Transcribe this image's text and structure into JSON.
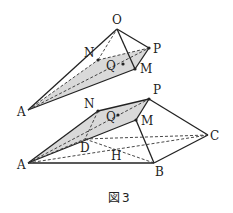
{
  "figure": {
    "caption_box": "図",
    "caption_num": "3",
    "shade_color": "#d9d9d9",
    "line_color": "#222222"
  },
  "upper": {
    "labels": {
      "O": "O",
      "P": "P",
      "M": "M",
      "N": "N",
      "Q": "Q",
      "A": "A"
    },
    "points": {
      "O": [
        117,
        29
      ],
      "P": [
        149,
        48
      ],
      "M": [
        135,
        69
      ],
      "N": [
        98,
        60
      ],
      "Q": [
        118,
        64
      ],
      "A": [
        28,
        110
      ]
    }
  },
  "lower": {
    "labels": {
      "N": "N",
      "P": "P",
      "M": "M",
      "Q": "Q",
      "A": "A",
      "D": "D",
      "H": "H",
      "B": "B",
      "C": "C"
    },
    "points": {
      "N": [
        98,
        111
      ],
      "P": [
        149,
        99
      ],
      "M": [
        136,
        120
      ],
      "Q": [
        118,
        115
      ],
      "A": [
        28,
        163
      ],
      "D": [
        85,
        139
      ],
      "H": [
        115,
        160
      ],
      "B": [
        154,
        163
      ],
      "C": [
        208,
        135
      ]
    }
  }
}
